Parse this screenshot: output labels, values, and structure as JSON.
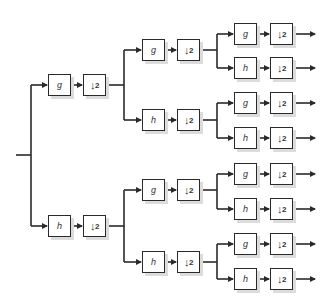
{
  "diagram": {
    "title": "",
    "type": "wavelet-packet-filter-bank",
    "levels": 3,
    "filter_labels": {
      "lowpass": "g",
      "highpass": "h"
    },
    "downsample_label": "2",
    "downsample_symbol": "↓",
    "colors": {
      "line": "#2a2a2a",
      "box_border": "#2a2a2a",
      "shadow": "#dcdcdc",
      "background": "#ffffff"
    },
    "nodes": [
      {
        "id": "l1-g",
        "level": 1,
        "filter": "g",
        "fx": 48,
        "dx": 83,
        "y": 85
      },
      {
        "id": "l1-h",
        "level": 1,
        "filter": "h",
        "fx": 48,
        "dx": 83,
        "y": 226
      },
      {
        "id": "l2-g-g",
        "level": 2,
        "filter": "g",
        "fx": 142,
        "dx": 177,
        "y": 50
      },
      {
        "id": "l2-g-h",
        "level": 2,
        "filter": "h",
        "fx": 142,
        "dx": 177,
        "y": 120
      },
      {
        "id": "l2-h-g",
        "level": 2,
        "filter": "g",
        "fx": 142,
        "dx": 177,
        "y": 190
      },
      {
        "id": "l2-h-h",
        "level": 2,
        "filter": "h",
        "fx": 142,
        "dx": 177,
        "y": 262
      },
      {
        "id": "l3-1",
        "level": 3,
        "filter": "g",
        "fx": 234,
        "dx": 270,
        "y": 34
      },
      {
        "id": "l3-2",
        "level": 3,
        "filter": "h",
        "fx": 234,
        "dx": 270,
        "y": 68
      },
      {
        "id": "l3-3",
        "level": 3,
        "filter": "g",
        "fx": 234,
        "dx": 270,
        "y": 103
      },
      {
        "id": "l3-4",
        "level": 3,
        "filter": "h",
        "fx": 234,
        "dx": 270,
        "y": 138
      },
      {
        "id": "l3-5",
        "level": 3,
        "filter": "g",
        "fx": 234,
        "dx": 270,
        "y": 174
      },
      {
        "id": "l3-6",
        "level": 3,
        "filter": "h",
        "fx": 234,
        "dx": 270,
        "y": 209
      },
      {
        "id": "l3-7",
        "level": 3,
        "filter": "g",
        "fx": 234,
        "dx": 270,
        "y": 244
      },
      {
        "id": "l3-8",
        "level": 3,
        "filter": "h",
        "fx": 234,
        "dx": 270,
        "y": 279
      }
    ]
  }
}
